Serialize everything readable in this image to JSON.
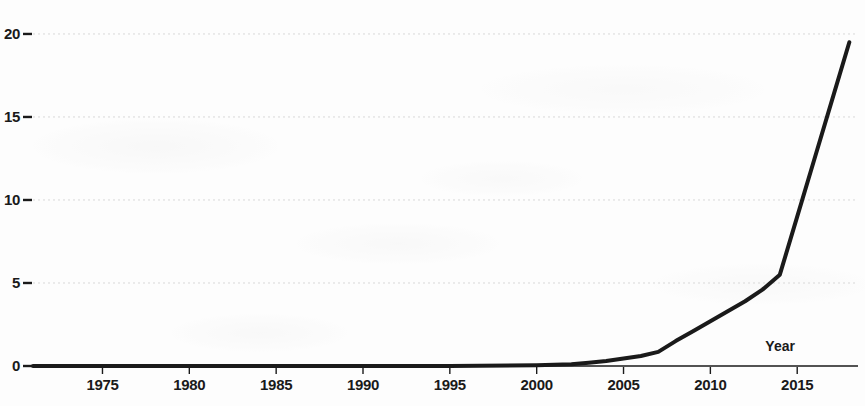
{
  "chart_data": {
    "type": "line",
    "title": "",
    "subtitle": "",
    "xlabel": "Year",
    "ylabel": "",
    "xlim": [
      1971,
      2018.5
    ],
    "ylim": [
      0,
      20.6
    ],
    "grid": true,
    "grid_axis": "y",
    "legend": false,
    "legend_position": "none",
    "xticks": [
      1975,
      1980,
      1985,
      1990,
      1995,
      2000,
      2005,
      2010,
      2015
    ],
    "xtick_labels": [
      "1975",
      "1980",
      "1985",
      "1990",
      "1995",
      "2000",
      "2005",
      "2010",
      "2015"
    ],
    "yticks": [
      0,
      5,
      10,
      15,
      20
    ],
    "ytick_labels": [
      "0",
      "5",
      "10",
      "15",
      "20"
    ],
    "series": [
      {
        "name": "Publications",
        "color": "#1a1a1a",
        "line_width": 4,
        "x": [
          1971,
          1975,
          1980,
          1985,
          1990,
          1995,
          2000,
          2002,
          2003,
          2004,
          2005,
          2006,
          2007,
          2008,
          2009,
          2010,
          2011,
          2012,
          2013,
          2014,
          2015,
          2016,
          2017,
          2018
        ],
        "values": [
          0,
          0,
          0,
          0,
          0,
          0,
          0.05,
          0.1,
          0.2,
          0.3,
          0.45,
          0.6,
          0.85,
          1.5,
          2.1,
          2.7,
          3.3,
          3.9,
          4.6,
          5.5,
          9.0,
          12.5,
          16.0,
          19.5
        ]
      }
    ],
    "annotations": [
      {
        "text": "Year",
        "x": 2014.2,
        "y": 0.75,
        "role": "axis-title"
      }
    ]
  },
  "axis": {
    "x_title": "Year"
  },
  "colors": {
    "line": "#1a1a1a",
    "axis": "#1a1a1a",
    "grid": "#d8d8d8",
    "background": "#fdfdfd",
    "text": "#1a1a1a"
  }
}
